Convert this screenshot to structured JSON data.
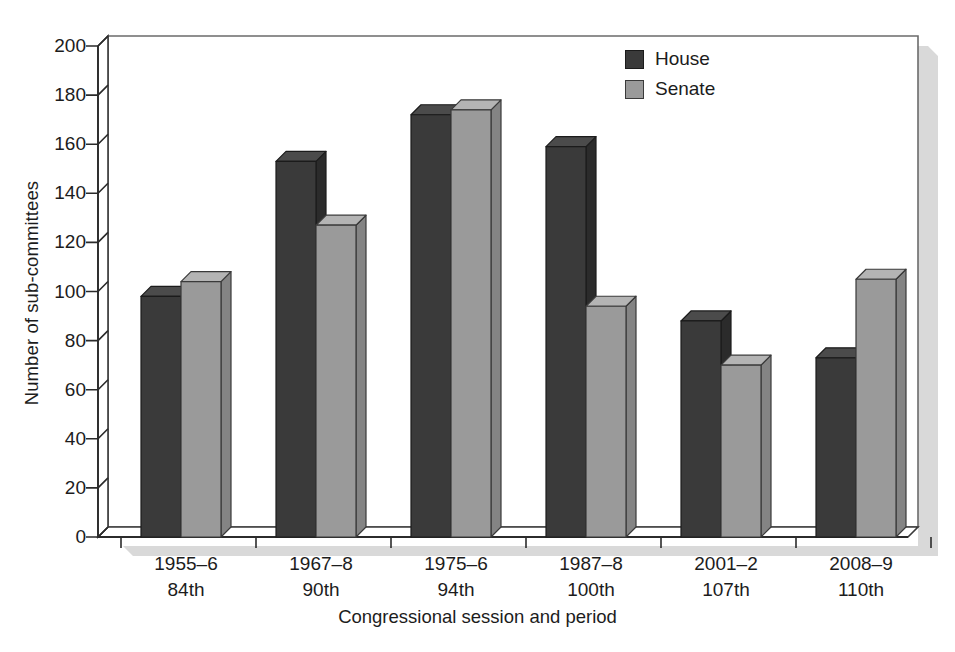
{
  "chart_data": {
    "type": "bar",
    "title": "",
    "subtitle": "",
    "xlabel": "Congressional session and period",
    "ylabel": "Number of sub-committees",
    "ylim": [
      0,
      200
    ],
    "yticks": [
      0,
      20,
      40,
      60,
      80,
      100,
      120,
      140,
      160,
      180,
      200
    ],
    "grid": false,
    "legend_position": "top-right",
    "categories": [
      "1955–6\n84th",
      "1967–8\n90th",
      "1975–6\n94th",
      "1987–8\n100th",
      "2001–2\n107th",
      "2008–9\n110th"
    ],
    "category_periods": [
      "1955–6",
      "1967–8",
      "1975–6",
      "1987–8",
      "2001–2",
      "2008–9"
    ],
    "category_sessions": [
      "84th",
      "90th",
      "94th",
      "100th",
      "107th",
      "110th"
    ],
    "series": [
      {
        "name": "House",
        "color": "#3a3a3a",
        "values": [
          98,
          153,
          172,
          159,
          88,
          73
        ]
      },
      {
        "name": "Senate",
        "color": "#9a9a9a",
        "values": [
          104,
          127,
          174,
          94,
          70,
          105
        ]
      }
    ]
  },
  "legend": {
    "items": [
      {
        "label": "House",
        "color": "#3a3a3a"
      },
      {
        "label": "Senate",
        "color": "#9a9a9a"
      }
    ]
  },
  "axes": {
    "y_title": "Number of sub-committees",
    "x_title": "Congressional session and period",
    "y_tick_labels": [
      "200",
      "180",
      "160",
      "140",
      "120",
      "100",
      "80",
      "60",
      "40",
      "20",
      "0"
    ]
  },
  "colors": {
    "house": "#3a3a3a",
    "house_top": "#4b4b4b",
    "house_side": "#2b2b2b",
    "senate": "#9a9a9a",
    "senate_top": "#b4b4b4",
    "senate_side": "#848484",
    "axis": "#2b2b2b",
    "background": "#ffffff"
  }
}
